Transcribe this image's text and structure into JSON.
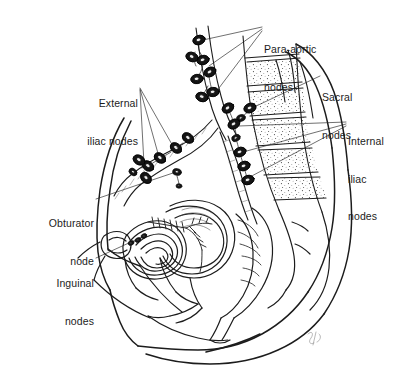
{
  "figure": {
    "background_color": "#ffffff",
    "ink_color": "#1c1c1c",
    "node_fill_color": "#111111",
    "signature": "Suk"
  },
  "labels": [
    {
      "id": "para-aortic",
      "text_lines": [
        "Para-aortic",
        "nodes"
      ],
      "align": "left",
      "x": 264,
      "y": 18,
      "leader_count": 3
    },
    {
      "id": "sacral",
      "text_lines": [
        "Sacral",
        "nodes"
      ],
      "align": "left",
      "x": 322,
      "y": 66,
      "leader_count": 1
    },
    {
      "id": "internal-iliac",
      "text_lines": [
        "Internal",
        "iliac",
        "nodes"
      ],
      "align": "left",
      "x": 348,
      "y": 110,
      "leader_count": 3
    },
    {
      "id": "external-iliac",
      "text_lines": [
        "External",
        "iliac nodes"
      ],
      "align": "right",
      "x": 58,
      "y": 72,
      "leader_count": 3
    },
    {
      "id": "obturator",
      "text_lines": [
        "Obturator",
        "node"
      ],
      "align": "right",
      "x": 16,
      "y": 192,
      "leader_count": 1
    },
    {
      "id": "inguinal",
      "text_lines": [
        "Inguinal",
        "nodes"
      ],
      "align": "right",
      "x": 28,
      "y": 252,
      "leader_count": 1
    }
  ],
  "node_chains": [
    {
      "id": "para-aortic-chain",
      "label": "Para-aortic nodes",
      "node_count": 7
    },
    {
      "id": "sacral-chain",
      "label": "Sacral nodes",
      "node_count": 2
    },
    {
      "id": "internal-iliac-chain",
      "label": "Internal iliac nodes",
      "node_count": 6
    },
    {
      "id": "external-iliac-chain",
      "label": "External iliac nodes",
      "node_count": 7
    },
    {
      "id": "obturator-chain",
      "label": "Obturator node",
      "node_count": 2
    },
    {
      "id": "inguinal-chain",
      "label": "Inguinal nodes",
      "node_count": 3
    }
  ],
  "anatomy": [
    {
      "id": "body-outline",
      "name": "Body outline (abdomen, back, thigh)"
    },
    {
      "id": "lumbar-vertebrae",
      "name": "Lumbar vertebral bodies"
    },
    {
      "id": "sacrum",
      "name": "Sacrum"
    },
    {
      "id": "pubic-symphysis",
      "name": "Pubic symphysis"
    },
    {
      "id": "bladder",
      "name": "Urinary bladder"
    },
    {
      "id": "uterus",
      "name": "Uterus and endometrium"
    },
    {
      "id": "vagina",
      "name": "Vagina"
    },
    {
      "id": "rectum",
      "name": "Rectum"
    },
    {
      "id": "aorta",
      "name": "Aorta and iliac vessels"
    }
  ]
}
